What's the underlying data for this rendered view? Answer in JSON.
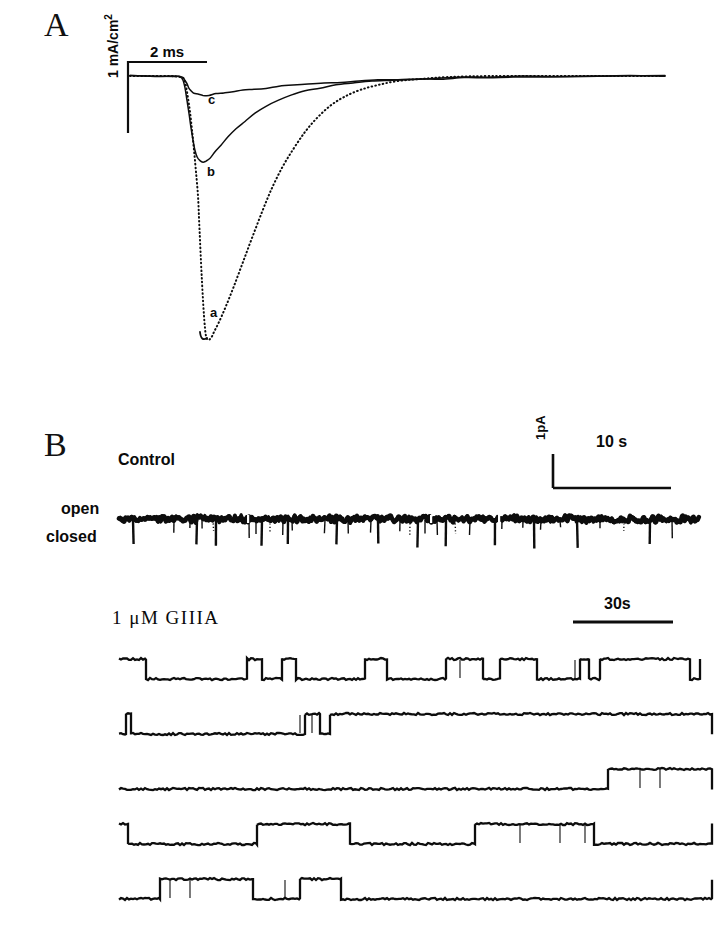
{
  "figure": {
    "panels": [
      {
        "letter": "A",
        "scale_bars": {
          "time": "2 ms",
          "current": "1 mA/cm2"
        },
        "trace_labels": [
          "a",
          "b",
          "c"
        ]
      },
      {
        "letter": "B",
        "condition_labels": {
          "control": "Control",
          "drug": "1 μM GIIIA"
        },
        "state_labels": {
          "open": "open",
          "closed": "closed"
        },
        "scale_bars": {
          "current": "1pA",
          "control_time": "10 s",
          "drug_time": "30s"
        }
      }
    ]
  },
  "panel_a": {
    "letter": "A",
    "time_scale_label": "2 ms",
    "current_scale_label": "1 mA/cm",
    "current_scale_exponent": "2",
    "label_a": "a",
    "label_b": "b",
    "label_c": "c"
  },
  "panel_b": {
    "letter": "B",
    "control_label": "Control",
    "open_label": "open",
    "closed_label": "closed",
    "current_scale_label": "1pA",
    "control_time_scale_label": "10 s",
    "drug_label": "1 μM GIIIA",
    "drug_time_scale_label": "30s"
  },
  "chart_data": {
    "type": "line",
    "panels": [
      {
        "id": "A",
        "type": "line",
        "xlabel": "time",
        "ylabel": "current density",
        "xscale_bar": {
          "label": "2 ms",
          "pixel_length": 79
        },
        "yscale_bar": {
          "label": "1 mA/cm2",
          "pixel_length": 71
        },
        "baseline_y_px": 76,
        "series": [
          {
            "name": "a",
            "style": "dotted",
            "peak_amplitude_mA_per_cm2": -3.7,
            "comment": "largest inward current, control",
            "points": [
              [
                130,
                76
              ],
              [
                152,
                76
              ],
              [
                170,
                76
              ],
              [
                180,
                77
              ],
              [
                184,
                79
              ],
              [
                186,
                86
              ],
              [
                188,
                98
              ],
              [
                190,
                112
              ],
              [
                192,
                130
              ],
              [
                194,
                150
              ],
              [
                196,
                172
              ],
              [
                198,
                196
              ],
              [
                199,
                218
              ],
              [
                200,
                240
              ],
              [
                201,
                262
              ],
              [
                202,
                282
              ],
              [
                203,
                300
              ],
              [
                204,
                316
              ],
              [
                205,
                328
              ],
              [
                206,
                336
              ],
              [
                208,
                340
              ],
              [
                211,
                338
              ],
              [
                214,
                332
              ],
              [
                219,
                322
              ],
              [
                226,
                306
              ],
              [
                234,
                286
              ],
              [
                243,
                262
              ],
              [
                252,
                238
              ],
              [
                262,
                212
              ],
              [
                272,
                188
              ],
              [
                283,
                166
              ],
              [
                294,
                148
              ],
              [
                305,
                132
              ],
              [
                317,
                118
              ],
              [
                330,
                106
              ],
              [
                344,
                97
              ],
              [
                360,
                90
              ],
              [
                378,
                85
              ],
              [
                398,
                81
              ],
              [
                420,
                79
              ],
              [
                450,
                77
              ],
              [
                490,
                76
              ],
              [
                540,
                76
              ],
              [
                600,
                76
              ],
              [
                665,
                76
              ]
            ]
          },
          {
            "name": "b",
            "style": "solid",
            "peak_amplitude_mA_per_cm2": -1.25,
            "comment": "partially blocked",
            "points": [
              [
                130,
                76
              ],
              [
                155,
                76
              ],
              [
                172,
                76
              ],
              [
                180,
                77
              ],
              [
                183,
                80
              ],
              [
                185,
                88
              ],
              [
                187,
                100
              ],
              [
                189,
                114
              ],
              [
                191,
                128
              ],
              [
                193,
                140
              ],
              [
                195,
                150
              ],
              [
                197,
                157
              ],
              [
                200,
                161
              ],
              [
                203,
                162
              ],
              [
                206,
                161
              ],
              [
                210,
                158
              ],
              [
                215,
                152
              ],
              [
                221,
                145
              ],
              [
                228,
                137
              ],
              [
                236,
                129
              ],
              [
                245,
                121
              ],
              [
                255,
                113
              ],
              [
                266,
                106
              ],
              [
                278,
                100
              ],
              [
                291,
                95
              ],
              [
                305,
                91
              ],
              [
                320,
                88
              ],
              [
                336,
                85
              ],
              [
                353,
                83
              ],
              [
                372,
                81
              ],
              [
                392,
                80
              ],
              [
                414,
                79
              ],
              [
                438,
                78
              ],
              [
                464,
                77
              ],
              [
                492,
                77
              ],
              [
                522,
                76
              ],
              [
                556,
                76
              ],
              [
                596,
                76
              ],
              [
                630,
                76
              ],
              [
                665,
                76
              ]
            ]
          },
          {
            "name": "c",
            "style": "solid",
            "peak_amplitude_mA_per_cm2": -0.33,
            "comment": "most blocked by toxin",
            "points": [
              [
                130,
                76
              ],
              [
                160,
                76
              ],
              [
                175,
                76
              ],
              [
                180,
                76
              ],
              [
                183,
                77
              ],
              [
                185,
                80
              ],
              [
                187,
                84
              ],
              [
                189,
                88
              ],
              [
                191,
                91
              ],
              [
                194,
                93
              ],
              [
                198,
                94
              ],
              [
                203,
                95
              ],
              [
                209,
                95
              ],
              [
                216,
                94
              ],
              [
                224,
                93
              ],
              [
                233,
                92
              ],
              [
                243,
                90
              ],
              [
                254,
                89
              ],
              [
                266,
                88
              ],
              [
                279,
                86
              ],
              [
                293,
                85
              ],
              [
                308,
                84
              ],
              [
                324,
                83
              ],
              [
                341,
                82
              ],
              [
                359,
                81
              ],
              [
                378,
                80
              ],
              [
                398,
                80
              ],
              [
                419,
                79
              ],
              [
                441,
                79
              ],
              [
                464,
                78
              ],
              [
                488,
                78
              ],
              [
                513,
                77
              ],
              [
                540,
                77
              ],
              [
                568,
                77
              ],
              [
                598,
                76
              ],
              [
                630,
                76
              ],
              [
                665,
                76
              ]
            ]
          }
        ]
      },
      {
        "id": "B-control",
        "type": "line",
        "label": "Control",
        "description": "single-channel record, channel mostly open with brief closures",
        "open_level_y_px": 519,
        "closed_level_y_px": 546,
        "xscale_bar": {
          "label": "10 s",
          "pixel_length": 118
        },
        "yscale_bar": {
          "label": "1pA",
          "pixel_length": 34
        },
        "x_start": 119,
        "x_end": 700,
        "closure_events_x_px": [
          133,
          174,
          190,
          197,
          202,
          213,
          216,
          249,
          256,
          262,
          270,
          283,
          288,
          292,
          325,
          337,
          348,
          371,
          378,
          400,
          410,
          418,
          425,
          437,
          446,
          455,
          470,
          495,
          502,
          523,
          534,
          541,
          560,
          577,
          600,
          624,
          650,
          672
        ]
      },
      {
        "id": "B-giiia",
        "type": "line",
        "label": "1 μM GIIIA",
        "description": "single-channel records in toxin: long-lived blocked (closed) and unblocked (open) sojourns",
        "xscale_bar": {
          "label": "30s",
          "pixel_length": 100
        },
        "rows": [
          {
            "row": 1,
            "y_open_px": 659,
            "y_closed_px": 679,
            "transitions_x_px": [
              119,
              146,
              247,
              262,
              282,
              296,
              365,
              387,
              446,
              483,
              500,
              537,
              580,
              589,
              600,
              690,
              700
            ],
            "start_state": "open"
          },
          {
            "row": 2,
            "y_open_px": 714,
            "y_closed_px": 734,
            "transitions_x_px": [
              119,
              126,
              131,
              305,
              320,
              330,
              712
            ],
            "start_state": "closed"
          },
          {
            "row": 3,
            "y_open_px": 769,
            "y_closed_px": 789,
            "transitions_x_px": [
              119,
              608,
              712
            ],
            "start_state": "closed"
          },
          {
            "row": 4,
            "y_open_px": 824,
            "y_closed_px": 844,
            "transitions_x_px": [
              119,
              128,
              257,
              350,
              475,
              594,
              712
            ],
            "start_state": "open"
          },
          {
            "row": 5,
            "y_open_px": 879,
            "y_closed_px": 899,
            "transitions_x_px": [
              119,
              160,
              253,
              300,
              341,
              712
            ],
            "start_state": "closed"
          }
        ]
      }
    ]
  }
}
